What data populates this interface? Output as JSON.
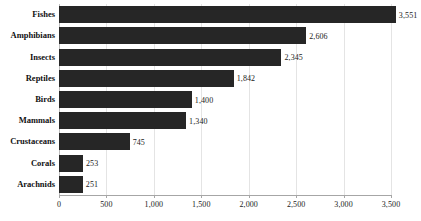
{
  "chart_data": {
    "type": "bar",
    "orientation": "horizontal",
    "title": "",
    "subtitle": "",
    "xlabel": "",
    "ylabel": "",
    "xlim": [
      0,
      3500
    ],
    "grid": true,
    "legend": false,
    "legend_position": "none",
    "bar_color": "#262626",
    "gridline_color": "#e4e4e4",
    "axis_color": "#a6a6a6",
    "categories": [
      "Fishes",
      "Amphibians",
      "Insects",
      "Reptiles",
      "Birds",
      "Mammals",
      "Crustaceans",
      "Corals",
      "Arachnids"
    ],
    "values": [
      3551,
      2606,
      2345,
      1842,
      1400,
      1340,
      745,
      253,
      251
    ],
    "value_labels": [
      "3,551",
      "2,606",
      "2,345",
      "1,842",
      "1,400",
      "1,340",
      "745",
      "253",
      "251"
    ],
    "xticks": [
      0,
      500,
      1000,
      1500,
      2000,
      2500,
      3000,
      3500
    ],
    "xtick_labels": [
      "0",
      "500",
      "1,000",
      "1,500",
      "2,000",
      "2,500",
      "3,000",
      "3,500"
    ]
  }
}
